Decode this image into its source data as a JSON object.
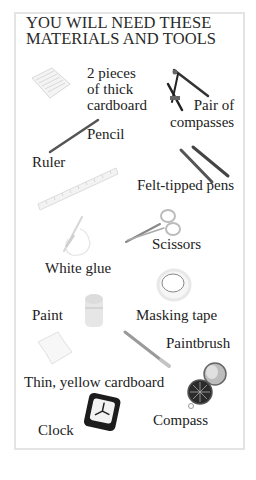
{
  "title": {
    "line1": "YOU WILL NEED THESE",
    "line2": "MATERIALS AND TOOLS"
  },
  "items": [
    {
      "id": "thick-cardboard",
      "lines": [
        "2 pieces",
        "of thick",
        "cardboard"
      ],
      "icon": "cardboard-stack-icon"
    },
    {
      "id": "pair-of-compasses",
      "lines": [
        "Pair of",
        "compasses"
      ],
      "icon": "drawing-compass-icon"
    },
    {
      "id": "pencil",
      "label": "Pencil",
      "icon": "pencil-icon"
    },
    {
      "id": "ruler",
      "label": "Ruler",
      "icon": "ruler-icon"
    },
    {
      "id": "felt-tipped-pens",
      "label": "Felt-tipped pens",
      "icon": "felt-pens-icon"
    },
    {
      "id": "scissors",
      "label": "Scissors",
      "icon": "scissors-icon"
    },
    {
      "id": "white-glue",
      "label": "White glue",
      "icon": "glue-bottle-icon"
    },
    {
      "id": "paint",
      "label": "Paint",
      "icon": "paint-pot-icon"
    },
    {
      "id": "masking-tape",
      "label": "Masking tape",
      "icon": "tape-roll-icon"
    },
    {
      "id": "paintbrush",
      "label": "Paintbrush",
      "icon": "paintbrush-icon"
    },
    {
      "id": "yellow-cardboard",
      "label": "Thin, yellow cardboard",
      "icon": "thin-card-icon"
    },
    {
      "id": "compass",
      "label": "Compass",
      "icon": "magnetic-compass-icon"
    },
    {
      "id": "clock",
      "label": "Clock",
      "icon": "alarm-clock-icon"
    }
  ],
  "colors": {
    "border": "#e4e4e4",
    "text": "#1e1e1e",
    "background": "#ffffff"
  }
}
